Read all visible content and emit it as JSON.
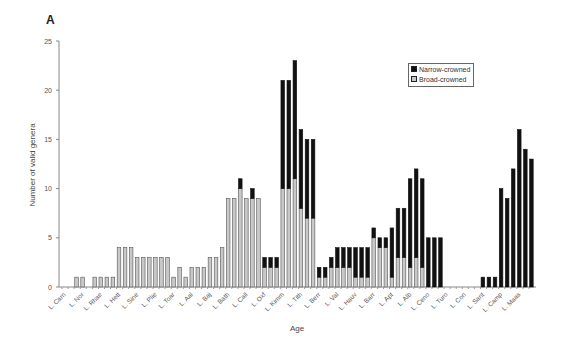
{
  "panel_label": "A",
  "chart_data": {
    "type": "bar",
    "stacked": true,
    "title": "",
    "xlabel": "Age",
    "ylabel": "Number of valid genera",
    "ylim": [
      0,
      25
    ],
    "yticks": [
      0,
      5,
      10,
      15,
      20,
      25
    ],
    "grid": false,
    "legend_position": "upper right (inside)",
    "tick_labels": [
      "L. Carn",
      "L. Nor",
      "L. Rhae",
      "L. Hett",
      "L. Sine",
      "L. Plie",
      "L. Toar",
      "L. Aal",
      "L. Baj",
      "L. Bath",
      "L. Call",
      "L. Oxf",
      "L. Kimm",
      "L. Tith",
      "L. Berr",
      "L. Val",
      "L. Hauv",
      "L. Barr",
      "L. Apt",
      "L. Alb",
      "L. Ceno",
      "L. Turo",
      "L. Con",
      "L. Sant",
      "L. Camp",
      "L. Maas"
    ],
    "tick_label_every_n_bars": 3,
    "num_bars": 78,
    "series": [
      {
        "name": "Broad-crowned",
        "color": "#c8c8c8",
        "values": [
          0,
          0,
          1,
          1,
          0,
          1,
          1,
          1,
          1,
          4,
          4,
          4,
          3,
          3,
          3,
          3,
          3,
          3,
          1,
          2,
          1,
          2,
          2,
          2,
          3,
          3,
          4,
          9,
          9,
          10,
          9,
          9,
          9,
          2,
          2,
          2,
          10,
          10,
          11,
          8,
          7,
          7,
          1,
          1,
          2,
          2,
          2,
          2,
          1,
          1,
          1,
          5,
          4,
          4,
          1,
          3,
          3,
          2,
          3,
          2,
          0,
          0,
          0,
          0,
          0,
          0,
          0,
          0,
          0,
          0,
          0,
          0,
          0,
          0,
          0,
          0,
          0,
          0
        ]
      },
      {
        "name": "Narrow-crowned",
        "color": "#111111",
        "values": [
          0,
          0,
          0,
          0,
          0,
          0,
          0,
          0,
          0,
          0,
          0,
          0,
          0,
          0,
          0,
          0,
          0,
          0,
          0,
          0,
          0,
          0,
          0,
          0,
          0,
          0,
          0,
          0,
          0,
          1,
          0,
          1,
          0,
          1,
          1,
          1,
          11,
          11,
          12,
          8,
          8,
          8,
          1,
          1,
          1,
          2,
          2,
          2,
          3,
          3,
          3,
          1,
          1,
          1,
          5,
          5,
          5,
          9,
          9,
          9,
          5,
          5,
          5,
          0,
          0,
          0,
          0,
          0,
          0,
          1,
          1,
          1,
          10,
          9,
          12,
          16,
          14,
          13
        ]
      }
    ],
    "totals": [
      0,
      0,
      1,
      1,
      0,
      1,
      1,
      1,
      1,
      4,
      4,
      4,
      3,
      3,
      3,
      3,
      3,
      3,
      1,
      2,
      1,
      2,
      2,
      2,
      3,
      3,
      4,
      9,
      9,
      11,
      9,
      10,
      9,
      3,
      3,
      3,
      21,
      21,
      23,
      16,
      15,
      15,
      2,
      2,
      3,
      4,
      4,
      4,
      4,
      4,
      4,
      6,
      5,
      5,
      6,
      8,
      8,
      11,
      12,
      11,
      5,
      5,
      5,
      0,
      0,
      0,
      0,
      0,
      0,
      1,
      1,
      1,
      10,
      9,
      12,
      16,
      14,
      13
    ]
  },
  "legend": {
    "items": [
      {
        "label": "Narrow-crowned",
        "color": "#111111"
      },
      {
        "label": "Broad-crowned",
        "color": "#c8c8c8"
      }
    ]
  }
}
